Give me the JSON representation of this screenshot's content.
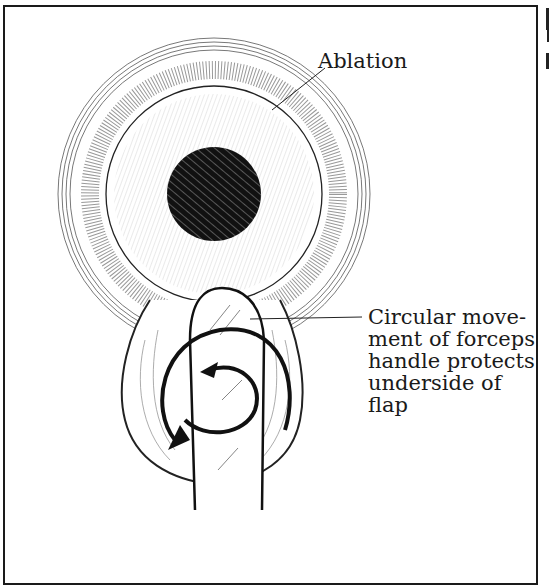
{
  "figure": {
    "labels": {
      "ablation": "Ablation",
      "circular": "Circular move-\nment of forceps\nhandle protects\nunderside of\nflap"
    },
    "colors": {
      "ink": "#1a1a1a",
      "pupil": "#111111",
      "paper": "#ffffff"
    }
  }
}
